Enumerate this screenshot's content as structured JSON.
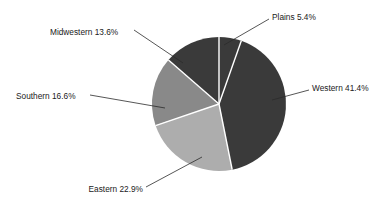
{
  "chart_data": {
    "type": "pie",
    "title": "",
    "subtitle": "",
    "xlabel": "",
    "ylabel": "",
    "legend_position": "none",
    "grid": false,
    "labels_outside": true,
    "start_angle_deg": 0,
    "direction": "clockwise",
    "categories": [
      "Plains",
      "Western",
      "Eastern",
      "Southern",
      "Midwestern"
    ],
    "values": [
      5.4,
      22.9,
      16.6,
      13.6,
      41.4
    ],
    "units": "percent",
    "slices": [
      {
        "name": "Plains",
        "label": "Plains 5.4%",
        "value": 5.4,
        "color": "#3a3a3a",
        "label_x": 272,
        "label_y": 18,
        "label_anchor": "start",
        "leader_from_x": 269,
        "leader_from_y": 19,
        "leader_to_x": 224,
        "leader_to_y": 45
      },
      {
        "name": "Western",
        "label": "Western 41.4%",
        "value": 41.4,
        "color": "#3a3a3a",
        "label_x": 312,
        "label_y": 89,
        "label_anchor": "start",
        "leader_from_x": 309,
        "leader_from_y": 90,
        "leader_to_x": 272,
        "leader_to_y": 100
      },
      {
        "name": "Eastern",
        "label": "Eastern 22.9%",
        "value": 22.9,
        "color": "#adadad",
        "label_x": 143,
        "label_y": 190,
        "label_anchor": "end",
        "leader_from_x": 146,
        "leader_from_y": 187,
        "leader_to_x": 202,
        "leader_to_y": 157
      },
      {
        "name": "Southern",
        "label": "Southern 16.6%",
        "value": 16.6,
        "color": "#898989",
        "label_x": 16,
        "label_y": 97,
        "label_anchor": "start",
        "leader_from_x": 90,
        "leader_from_y": 95,
        "leader_to_x": 165,
        "leader_to_y": 108
      },
      {
        "name": "Midwestern",
        "label": "Midwestern 13.6%",
        "value": 13.6,
        "color": "#3a3a3a",
        "label_x": 50,
        "label_y": 33,
        "label_anchor": "start",
        "leader_from_x": 134,
        "leader_from_y": 30,
        "leader_to_x": 183,
        "leader_to_y": 63
      }
    ],
    "geometry": {
      "center_x": 219,
      "center_y": 104,
      "radius": 67
    },
    "colors": {
      "dark_gray": "#3a3a3a",
      "medium_gray": "#898989",
      "light_gray": "#adadad",
      "separator": "#ffffff",
      "background": "#ffffff",
      "text": "#1a1a1a"
    }
  }
}
